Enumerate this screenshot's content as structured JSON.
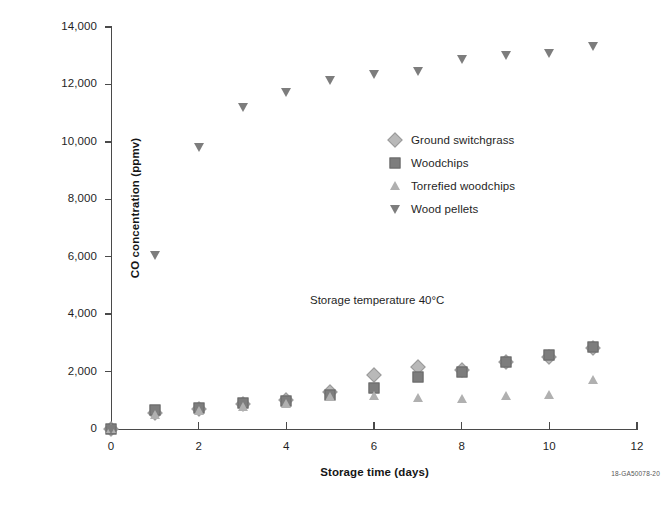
{
  "figure": {
    "id_label": "18-GA50078-20",
    "annotation": "Storage temperature 40°C"
  },
  "chart_data": {
    "type": "scatter",
    "title": "",
    "xlabel": "Storage time (days)",
    "ylabel": "CO concentration (ppmv)",
    "xlim": [
      0,
      12
    ],
    "ylim": [
      0,
      14000
    ],
    "xticks": [
      "0",
      "2",
      "4",
      "6",
      "8",
      "10",
      "12"
    ],
    "xtick_values": [
      0,
      2,
      4,
      6,
      8,
      10,
      12
    ],
    "yticks": [
      "0",
      "2,000",
      "4,000",
      "6,000",
      "8,000",
      "10,000",
      "12,000",
      "14,000"
    ],
    "ytick_values": [
      0,
      2000,
      4000,
      6000,
      8000,
      10000,
      12000,
      14000
    ],
    "grid": false,
    "legend_position": "center",
    "series": [
      {
        "name": "Ground switchgrass",
        "marker": "diamond",
        "color": "#b9b9b9",
        "x": [
          0,
          1,
          2,
          3,
          4,
          5,
          6,
          7,
          8,
          9,
          10,
          11
        ],
        "values": [
          0,
          560,
          700,
          880,
          1010,
          1280,
          1880,
          2150,
          2050,
          2350,
          2520,
          2830
        ]
      },
      {
        "name": "Woodchips",
        "marker": "square",
        "color": "#7d7d7d",
        "x": [
          0,
          1,
          2,
          3,
          4,
          5,
          6,
          7,
          8,
          9,
          10,
          11
        ],
        "values": [
          0,
          650,
          740,
          900,
          960,
          1180,
          1420,
          1800,
          2000,
          2330,
          2560,
          2870
        ]
      },
      {
        "name": "Torrefied woodchips",
        "marker": "triangle-up",
        "color": "#b0b0b0",
        "x": [
          0,
          1,
          2,
          3,
          4,
          5,
          6,
          7,
          8,
          9,
          10,
          11
        ],
        "values": [
          0,
          480,
          640,
          780,
          880,
          1100,
          1150,
          1080,
          1050,
          1140,
          1200,
          1700
        ]
      },
      {
        "name": "Wood pellets",
        "marker": "triangle-down",
        "color": "#7d7d7d",
        "x": [
          0,
          1,
          2,
          3,
          4,
          5,
          6,
          7,
          8,
          9,
          10,
          11
        ],
        "values": [
          0,
          6050,
          9820,
          11200,
          11750,
          12150,
          12350,
          12470,
          12900,
          13020,
          13100,
          13350
        ]
      }
    ]
  }
}
